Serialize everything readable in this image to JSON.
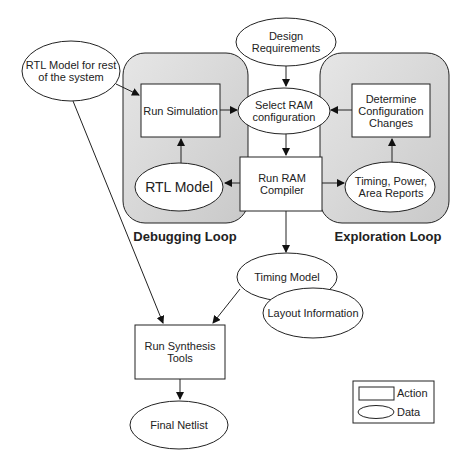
{
  "diagram": {
    "nodes": {
      "rtl_rest": {
        "label": "RTL Model for rest of the system",
        "type": "data"
      },
      "design_req": {
        "label": "Design Requirements",
        "type": "data"
      },
      "run_sim": {
        "label": "Run Simulation",
        "type": "action"
      },
      "select_ram": {
        "label": "Select RAM configuration",
        "type": "data"
      },
      "determine": {
        "label": "Determine Configuration Changes",
        "type": "action"
      },
      "rtl_model": {
        "label": "RTL Model",
        "type": "data"
      },
      "run_ram": {
        "label": "Run RAM Compiler",
        "type": "action"
      },
      "reports": {
        "label": "Timing, Power, Area Reports",
        "type": "data"
      },
      "timing_model": {
        "label": "Timing Model",
        "type": "data"
      },
      "layout_info": {
        "label": "Layout Information",
        "type": "data"
      },
      "run_synth": {
        "label": "Run Synthesis Tools",
        "type": "action"
      },
      "final_netlist": {
        "label": "Final Netlist",
        "type": "data"
      }
    },
    "groups": {
      "debug": "Debugging Loop",
      "explore": "Exploration Loop"
    },
    "legend": {
      "action": "Action",
      "data": "Data"
    },
    "edges": [
      [
        "rtl_rest",
        "run_sim"
      ],
      [
        "design_req",
        "select_ram"
      ],
      [
        "run_sim",
        "select_ram"
      ],
      [
        "determine",
        "select_ram"
      ],
      [
        "select_ram",
        "run_ram"
      ],
      [
        "rtl_model",
        "run_sim"
      ],
      [
        "run_ram",
        "rtl_model"
      ],
      [
        "run_ram",
        "reports"
      ],
      [
        "reports",
        "determine"
      ],
      [
        "run_ram",
        "timing_model"
      ],
      [
        "rtl_rest",
        "run_synth"
      ],
      [
        "timing_model",
        "run_synth"
      ],
      [
        "run_synth",
        "final_netlist"
      ]
    ]
  }
}
